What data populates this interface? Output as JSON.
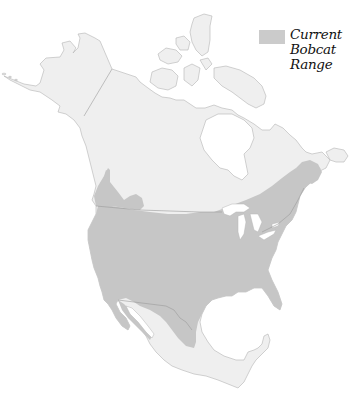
{
  "map": {
    "title": "Current Bobcat Range",
    "region": "North America",
    "colors": {
      "background": "#ffffff",
      "land": "#efefef",
      "range": "#c6c6c6",
      "border": "#a9a9a9",
      "water": "#ffffff"
    }
  },
  "legend": {
    "items": [
      {
        "label_lines": [
          "Current",
          "Bobcat",
          "Range"
        ],
        "swatch_color": "#cbcbcb"
      }
    ],
    "line1": "Current",
    "line2": "Bobcat",
    "line3": "Range"
  }
}
